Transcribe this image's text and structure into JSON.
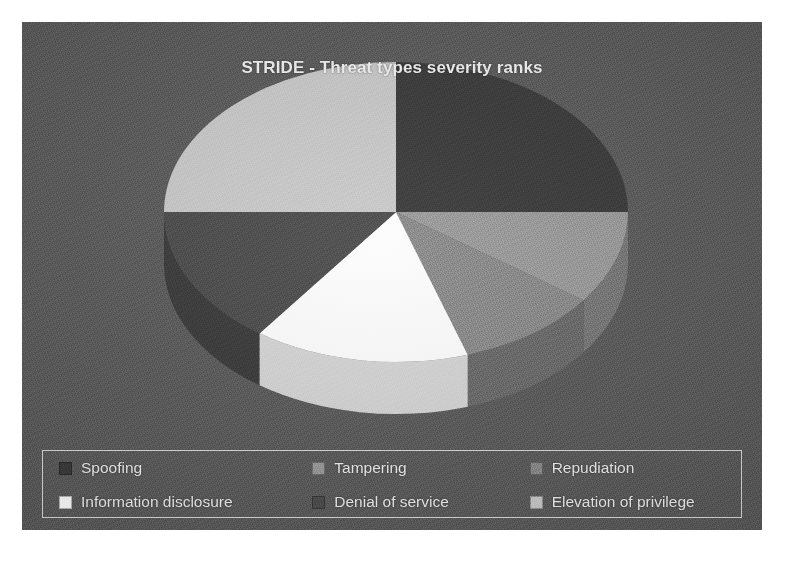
{
  "chart_title": "STRIDE - Threat types severity ranks",
  "chart_data": {
    "type": "pie",
    "title": "STRIDE - Threat types severity ranks",
    "subtitle": "",
    "xlabel": "",
    "ylabel": "",
    "three_d": true,
    "start_angle_deg": 0,
    "direction": "clockwise",
    "legend_position": "bottom",
    "grid": false,
    "categories": [
      "Spoofing",
      "Tampering",
      "Repudiation",
      "Information disclosure",
      "Denial of service",
      "Elevation of privilege"
    ],
    "values": [
      25,
      10,
      10,
      15,
      15,
      25
    ],
    "units": "percent",
    "slice_colors": [
      "#3a3a3a",
      "#9a9a9a",
      "#8a8a8a",
      "#fdfdfd",
      "#4c4c4c",
      "#c9c9c9"
    ],
    "slice_side_colors": [
      "#2b2b2b",
      "#777777",
      "#6a6a6a",
      "#d5d5d5",
      "#3a3a3a",
      "#a3a3a3"
    ],
    "slices": [
      {
        "label": "Spoofing",
        "value": 25,
        "color": "#3a3a3a",
        "side_color": "#2b2b2b"
      },
      {
        "label": "Tampering",
        "value": 10,
        "color": "#9a9a9a",
        "side_color": "#777777"
      },
      {
        "label": "Repudiation",
        "value": 10,
        "color": "#8a8a8a",
        "side_color": "#6a6a6a"
      },
      {
        "label": "Information disclosure",
        "value": 15,
        "color": "#fdfdfd",
        "side_color": "#d5d5d5"
      },
      {
        "label": "Denial of service",
        "value": 15,
        "color": "#4c4c4c",
        "side_color": "#3a3a3a"
      },
      {
        "label": "Elevation of privilege",
        "value": 25,
        "color": "#c9c9c9",
        "side_color": "#a3a3a3"
      }
    ]
  },
  "legend": {
    "rows": [
      [
        {
          "label": "Spoofing",
          "color": "#3a3a3a"
        },
        {
          "label": "Tampering",
          "color": "#9a9a9a"
        },
        {
          "label": "Repudiation",
          "color": "#8a8a8a"
        }
      ],
      [
        {
          "label": "Information disclosure",
          "color": "#fdfdfd"
        },
        {
          "label": "Denial of service",
          "color": "#4c4c4c"
        },
        {
          "label": "Elevation of privilege",
          "color": "#c9c9c9"
        }
      ]
    ]
  },
  "colors": {
    "plot_background": "#5b5b5b",
    "page_background": "#ffffff",
    "title_text": "#f2f2f2",
    "legend_text": "#f0f0f0",
    "legend_border": "#d8d8d8"
  }
}
